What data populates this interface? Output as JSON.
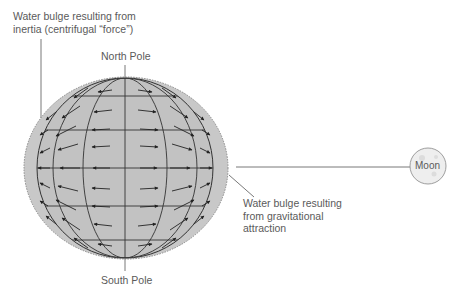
{
  "labels": {
    "inertia_bulge": [
      "Water bulge resulting from",
      "inertia (centrifugal “force”)"
    ],
    "north_pole": "North Pole",
    "south_pole": "South Pole",
    "gravity_bulge": [
      "Water bulge resulting",
      "from gravitational",
      "attraction"
    ],
    "moon": "Moon"
  },
  "colors": {
    "bulge_fill": "#c8c8c8",
    "earth_fill": "#c4c4c4",
    "line": "#333333",
    "moon_fill": "#eeeeee"
  }
}
